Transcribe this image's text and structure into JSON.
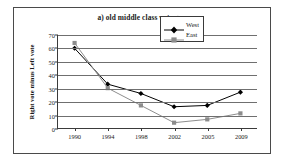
{
  "chart_data": {
    "type": "line",
    "title": "a) old middle class vote gap",
    "xlabel": "",
    "ylabel": "Right vote minus Left vote",
    "categories": [
      "1990",
      "1994",
      "1998",
      "2002",
      "2005",
      "2009"
    ],
    "ylim": [
      0,
      70
    ],
    "ytick_step": 10,
    "yticks": [
      "0",
      "10",
      "20",
      "30",
      "40",
      "50",
      "60",
      "70"
    ],
    "grid": "horizontal",
    "legend_position": "top-right",
    "series": [
      {
        "name": "West",
        "values": [
          60,
          33,
          26,
          16,
          17,
          27
        ],
        "color": "#000000",
        "marker": "diamond"
      },
      {
        "name": "East",
        "values": [
          64,
          30,
          17,
          4,
          6.5,
          11
        ],
        "color": "#8c8c8c",
        "marker": "square"
      }
    ]
  }
}
